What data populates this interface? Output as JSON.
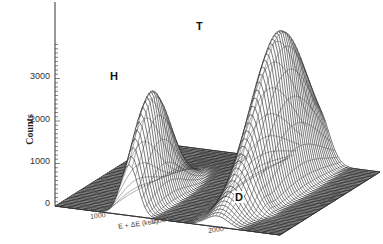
{
  "chart_data": {
    "type": "surface3d",
    "title": "",
    "zlabel": "Counts",
    "xlabel": "E + ΔE (keV)",
    "ylabel": "ΔE (keV)",
    "z_ticks": [
      "0",
      "1000",
      "2000",
      "3000"
    ],
    "z_range": [
      0,
      3800
    ],
    "x_ticks": [
      "1000",
      "1500",
      "2000"
    ],
    "peaks": [
      {
        "name": "H",
        "peak_counts": 2600,
        "label": "H"
      },
      {
        "name": "T",
        "peak_counts": 3700,
        "label": "T"
      },
      {
        "name": "D",
        "peak_counts": 150,
        "label": "D"
      }
    ],
    "grid": true
  },
  "labels": {
    "counts": "Counts",
    "H": "H",
    "T": "T",
    "D": "D",
    "x1000": "1000",
    "xaxis": "E + ΔE (keV)",
    "x1500": "1500",
    "x2000": "2000",
    "raxis": "ΔE (keV)"
  }
}
